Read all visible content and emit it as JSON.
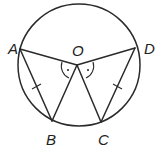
{
  "diagram": {
    "type": "geometry",
    "labels": {
      "A": "A",
      "B": "B",
      "C": "C",
      "D": "D",
      "O": "O"
    },
    "points": {
      "O": [
        77,
        65
      ],
      "A": [
        20,
        49
      ],
      "B": [
        52,
        121
      ],
      "C": [
        101,
        122
      ],
      "D": [
        135,
        48
      ]
    },
    "circle": {
      "center": [
        79,
        65
      ],
      "r": 61
    },
    "segments": [
      "OA",
      "OB",
      "OC",
      "OD",
      "AB",
      "CD"
    ],
    "equal_marks": [
      "AB",
      "CD"
    ],
    "angle_marks": [
      "AOB",
      "COD"
    ]
  }
}
